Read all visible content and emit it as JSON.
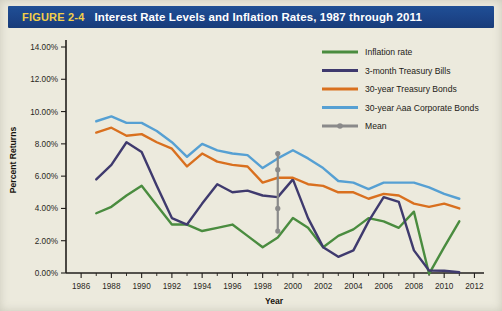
{
  "figure": {
    "number": "FIGURE 2-4",
    "title": "Interest Rate Levels and Inflation Rates, 1987 through 2011"
  },
  "colors": {
    "inflation": "#4a8c3f",
    "tbills": "#3f3a6e",
    "tbonds": "#d9701f",
    "corporate": "#56a0d3",
    "mean": "#8a8a8a",
    "title_bar": "#1c4488",
    "figure_number": "#f2cf4a",
    "panel_background": "#eceadd",
    "axis": "#221f1c"
  },
  "chart_data": {
    "type": "line",
    "title": "Interest Rate Levels and Inflation Rates, 1987 through 2011",
    "xlabel": "Year",
    "ylabel": "Percent Returns",
    "xlim": [
      1985,
      2012.5
    ],
    "ylim": [
      0,
      14
    ],
    "ytick_labels": [
      "0.00%",
      "2.00%",
      "4.00%",
      "6.00%",
      "8.00%",
      "10.00%",
      "12.00%",
      "14.00%"
    ],
    "ytick_values": [
      0,
      2,
      4,
      6,
      8,
      10,
      12,
      14
    ],
    "xtick_labels": [
      "1986",
      "1988",
      "1990",
      "1992",
      "1994",
      "1996",
      "1998",
      "2000",
      "2002",
      "2004",
      "2006",
      "2008",
      "2010",
      "2012"
    ],
    "xtick_values": [
      1986,
      1988,
      1990,
      1992,
      1994,
      1996,
      1998,
      2000,
      2002,
      2004,
      2006,
      2008,
      2010,
      2012
    ],
    "grid": false,
    "legend_position": "upper-right",
    "x": [
      1987,
      1988,
      1989,
      1990,
      1991,
      1992,
      1993,
      1994,
      1995,
      1996,
      1997,
      1998,
      1999,
      2000,
      2001,
      2002,
      2003,
      2004,
      2005,
      2006,
      2007,
      2008,
      2009,
      2010,
      2011
    ],
    "series": [
      {
        "name": "Inflation rate",
        "color": "#4a8c3f",
        "values": [
          3.7,
          4.1,
          4.8,
          5.4,
          4.2,
          3.0,
          3.0,
          2.6,
          2.8,
          3.0,
          2.3,
          1.6,
          2.2,
          3.4,
          2.8,
          1.6,
          2.3,
          2.7,
          3.4,
          3.2,
          2.8,
          3.8,
          -0.05,
          1.6,
          3.2
        ]
      },
      {
        "name": "3-month Treasury Bills",
        "color": "#3f3a6e",
        "values": [
          5.8,
          6.7,
          8.1,
          7.5,
          5.4,
          3.4,
          3.0,
          4.3,
          5.5,
          5.0,
          5.1,
          4.8,
          4.7,
          5.8,
          3.4,
          1.6,
          1.0,
          1.4,
          3.2,
          4.7,
          4.4,
          1.4,
          0.15,
          0.14,
          0.05
        ]
      },
      {
        "name": "30-year Treasury Bonds",
        "color": "#d9701f",
        "values": [
          8.7,
          9.0,
          8.5,
          8.6,
          8.1,
          7.7,
          6.6,
          7.4,
          6.9,
          6.7,
          6.6,
          5.6,
          5.9,
          5.9,
          5.5,
          5.4,
          5.0,
          5.0,
          4.6,
          4.9,
          4.8,
          4.3,
          4.1,
          4.3,
          4.0
        ]
      },
      {
        "name": "30-year Aaa Corporate Bonds",
        "color": "#56a0d3",
        "values": [
          9.4,
          9.7,
          9.3,
          9.3,
          8.8,
          8.1,
          7.2,
          8.0,
          7.6,
          7.4,
          7.3,
          6.5,
          7.1,
          7.6,
          7.1,
          6.5,
          5.7,
          5.6,
          5.2,
          5.6,
          5.6,
          5.6,
          5.3,
          4.9,
          4.6
        ]
      }
    ],
    "mean_marker": {
      "name": "Mean",
      "color": "#8a8a8a",
      "x": 1999,
      "points": [
        7.4,
        6.4,
        4.0,
        2.6
      ]
    }
  },
  "legend": [
    {
      "label": "Inflation rate",
      "color": "#4a8c3f",
      "style": "line"
    },
    {
      "label": "3-month Treasury Bills",
      "color": "#3f3a6e",
      "style": "line"
    },
    {
      "label": "30-year Treasury Bonds",
      "color": "#d9701f",
      "style": "line"
    },
    {
      "label": "30-year Aaa Corporate Bonds",
      "color": "#56a0d3",
      "style": "line"
    },
    {
      "label": "Mean",
      "color": "#8a8a8a",
      "style": "line-marker"
    }
  ]
}
